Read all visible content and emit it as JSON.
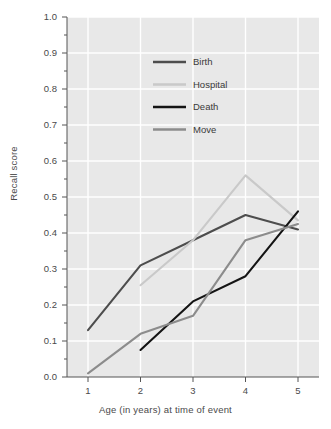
{
  "chart_data": {
    "type": "line",
    "title": "",
    "xlabel": "Age (in years) at time of event",
    "ylabel": "Recall score",
    "x": [
      1,
      2,
      3,
      4,
      5
    ],
    "xlim": [
      0.6,
      5.4
    ],
    "ylim": [
      0.0,
      1.0
    ],
    "xtick_labels": [
      "1",
      "2",
      "3",
      "4",
      "5"
    ],
    "ytick_labels": [
      "0.0",
      "0.1",
      "0.2",
      "0.3",
      "0.4",
      "0.5",
      "0.6",
      "0.7",
      "0.8",
      "0.9",
      "1.0"
    ],
    "ytick_values": [
      0.0,
      0.1,
      0.2,
      0.3,
      0.4,
      0.5,
      0.6,
      0.7,
      0.8,
      0.9,
      1.0
    ],
    "grid": true,
    "grid_color": "#ffffff",
    "plot_background": "#e8e8e8",
    "legend_position": "upper center",
    "series": [
      {
        "name": "Birth",
        "color": "#4d4d4d",
        "x": [
          1,
          2,
          3,
          4,
          5
        ],
        "values": [
          0.13,
          0.31,
          0.38,
          0.45,
          0.41
        ]
      },
      {
        "name": "Hospital",
        "color": "#c9c9c9",
        "x": [
          2,
          3,
          4,
          5
        ],
        "values": [
          0.255,
          0.38,
          0.56,
          0.435
        ]
      },
      {
        "name": "Death",
        "color": "#141414",
        "x": [
          2,
          3,
          4,
          5
        ],
        "values": [
          0.075,
          0.21,
          0.28,
          0.46
        ]
      },
      {
        "name": "Move",
        "color": "#8c8c8c",
        "x": [
          1,
          2,
          3,
          4,
          5
        ],
        "values": [
          0.01,
          0.12,
          0.17,
          0.38,
          0.425
        ]
      }
    ]
  },
  "axes": {
    "y_title": "Recall score",
    "x_title": "Age (in years) at time of event",
    "y_ticks": [
      {
        "label": "1.0"
      },
      {
        "label": "0.9"
      },
      {
        "label": "0.8"
      },
      {
        "label": "0.7"
      },
      {
        "label": "0.6"
      },
      {
        "label": "0.5"
      },
      {
        "label": "0.4"
      },
      {
        "label": "0.3"
      },
      {
        "label": "0.2"
      },
      {
        "label": "0.1"
      },
      {
        "label": "0.0"
      }
    ],
    "x_ticks": [
      {
        "label": "1"
      },
      {
        "label": "2"
      },
      {
        "label": "3"
      },
      {
        "label": "4"
      },
      {
        "label": "5"
      }
    ]
  },
  "legend": {
    "entries": [
      {
        "label": "Birth",
        "color": "#4d4d4d"
      },
      {
        "label": "Hospital",
        "color": "#c9c9c9"
      },
      {
        "label": "Death",
        "color": "#141414"
      },
      {
        "label": "Move",
        "color": "#8c8c8c"
      }
    ]
  }
}
